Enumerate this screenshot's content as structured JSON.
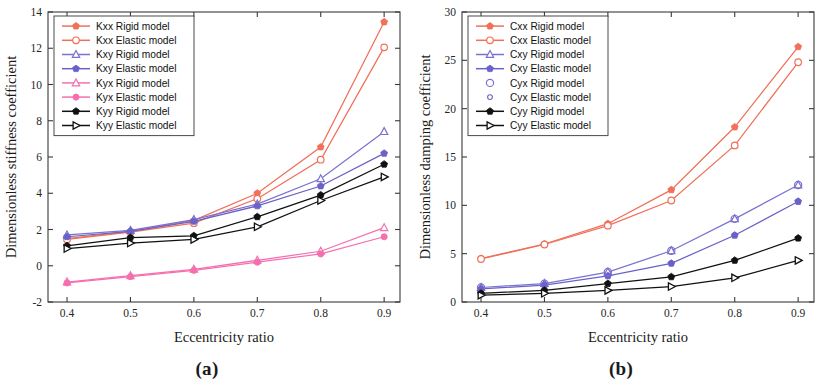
{
  "figure": {
    "panels": [
      {
        "id": "panel-a",
        "caption": "(a)",
        "chart_data": {
          "type": "line",
          "title": "",
          "xlabel": "Eccentricity ratio",
          "ylabel": "Dimensionless stiffness coefficient",
          "x": [
            0.4,
            0.5,
            0.6,
            0.7,
            0.8,
            0.9
          ],
          "xticks": [
            "0.4",
            "0.5",
            "0.6",
            "0.7",
            "0.8",
            "0.9"
          ],
          "xlim": [
            0.37,
            0.925
          ],
          "yticks": [
            "-2",
            "0",
            "2",
            "4",
            "6",
            "8",
            "10",
            "12",
            "14"
          ],
          "ylim": [
            -2,
            14
          ],
          "grid": false,
          "legend_position": "upper-left",
          "series": [
            {
              "name": "Kxx Rigid model",
              "color": "#f0705a",
              "marker": "pentagon-filled",
              "values": [
                1.5,
                1.9,
                2.5,
                4.0,
                6.55,
                13.45
              ]
            },
            {
              "name": "Kxx Elastic model",
              "color": "#f0705a",
              "marker": "circle-open",
              "values": [
                1.45,
                1.85,
                2.35,
                3.7,
                5.85,
                12.05
              ]
            },
            {
              "name": "Kxy Rigid model",
              "color": "#7b72d0",
              "marker": "triangle-open",
              "values": [
                1.7,
                1.95,
                2.55,
                3.4,
                4.8,
                7.4
              ]
            },
            {
              "name": "Kxy Elastic model",
              "color": "#6a62c8",
              "marker": "pentagon-filled",
              "values": [
                1.6,
                1.9,
                2.45,
                3.3,
                4.4,
                6.2
              ]
            },
            {
              "name": "Kyx Rigid model",
              "color": "#f56fae",
              "marker": "triangle-open",
              "values": [
                -0.9,
                -0.55,
                -0.2,
                0.3,
                0.8,
                2.1
              ]
            },
            {
              "name": "Kyx Elastic model",
              "color": "#f56fae",
              "marker": "circle-filled",
              "values": [
                -0.95,
                -0.6,
                -0.25,
                0.2,
                0.65,
                1.6
              ]
            },
            {
              "name": "Kyy Rigid model",
              "color": "#111111",
              "marker": "pentagon-filled",
              "values": [
                1.1,
                1.55,
                1.65,
                2.7,
                3.9,
                5.6
              ]
            },
            {
              "name": "Kyy Elastic model",
              "color": "#111111",
              "marker": "triangle-right-open",
              "values": [
                0.95,
                1.25,
                1.45,
                2.15,
                3.6,
                4.9
              ]
            }
          ]
        }
      },
      {
        "id": "panel-b",
        "caption": "(b)",
        "chart_data": {
          "type": "line",
          "title": "",
          "xlabel": "Eccentricity ratio",
          "ylabel": "Dimensionless damping coefficient",
          "x": [
            0.4,
            0.5,
            0.6,
            0.7,
            0.8,
            0.9
          ],
          "xticks": [
            "0.4",
            "0.5",
            "0.6",
            "0.7",
            "0.8",
            "0.9"
          ],
          "xlim": [
            0.37,
            0.925
          ],
          "yticks": [
            "0",
            "5",
            "10",
            "15",
            "20",
            "25",
            "30"
          ],
          "ylim": [
            0,
            30
          ],
          "grid": false,
          "legend_position": "upper-left",
          "series": [
            {
              "name": "Cxx Rigid model",
              "color": "#f0705a",
              "marker": "pentagon-filled",
              "values": [
                4.5,
                6.0,
                8.1,
                11.6,
                18.1,
                26.4
              ]
            },
            {
              "name": "Cxx Elastic model",
              "color": "#f0705a",
              "marker": "circle-open",
              "values": [
                4.45,
                5.95,
                7.9,
                10.5,
                16.2,
                24.8
              ]
            },
            {
              "name": "Cxy Rigid model",
              "color": "#7b72d0",
              "marker": "triangle-open",
              "values": [
                1.5,
                1.9,
                3.1,
                5.3,
                8.6,
                12.1
              ]
            },
            {
              "name": "Cxy Elastic model",
              "color": "#6a62c8",
              "marker": "pentagon-filled",
              "values": [
                1.35,
                1.75,
                2.7,
                4.0,
                6.9,
                10.4
              ]
            },
            {
              "name": "Cyx Rigid model",
              "color": "#7b72d0",
              "marker": "circle-open-large",
              "values": [
                1.5,
                1.9,
                3.1,
                5.3,
                8.6,
                12.1
              ]
            },
            {
              "name": "Cyx Elastic model",
              "color": "#6a62c8",
              "marker": "circle-open-small",
              "values": [
                1.35,
                1.75,
                2.7,
                4.0,
                6.9,
                10.4
              ]
            },
            {
              "name": "Cyy Rigid model",
              "color": "#111111",
              "marker": "pentagon-filled",
              "values": [
                0.9,
                1.2,
                1.9,
                2.6,
                4.3,
                6.6
              ]
            },
            {
              "name": "Cyy Elastic model",
              "color": "#111111",
              "marker": "triangle-right-open",
              "values": [
                0.7,
                0.9,
                1.2,
                1.6,
                2.5,
                4.3
              ]
            }
          ]
        }
      }
    ]
  }
}
